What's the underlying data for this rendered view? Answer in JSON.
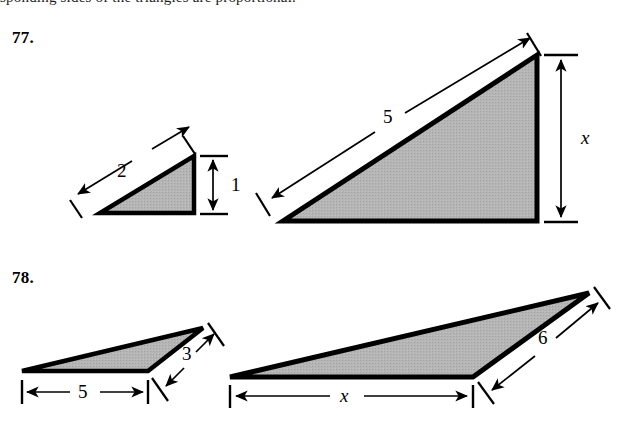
{
  "page": {
    "top_cut_text": "sponding sides of the triangles are proportional.",
    "background": "#ffffff",
    "ink_color": "#000000",
    "fill_color": "#b3b3b3"
  },
  "problems": [
    {
      "number": "77.",
      "figures": [
        {
          "name": "small-right-triangle",
          "labels": [
            {
              "text": "2",
              "role": "hypotenuse-length",
              "italic": false
            },
            {
              "text": "1",
              "role": "vertical-leg-length",
              "italic": false
            }
          ]
        },
        {
          "name": "large-right-triangle",
          "labels": [
            {
              "text": "5",
              "role": "hypotenuse-length",
              "italic": false
            },
            {
              "text": "x",
              "role": "vertical-leg-unknown",
              "italic": true
            }
          ]
        }
      ]
    },
    {
      "number": "78.",
      "figures": [
        {
          "name": "small-oblique-triangle",
          "labels": [
            {
              "text": "5",
              "role": "base-length",
              "italic": false
            },
            {
              "text": "3",
              "role": "right-side-length",
              "italic": false
            }
          ]
        },
        {
          "name": "large-oblique-triangle",
          "labels": [
            {
              "text": "x",
              "role": "base-unknown",
              "italic": true
            },
            {
              "text": "6",
              "role": "right-side-length",
              "italic": false
            }
          ]
        }
      ]
    }
  ],
  "labels": {
    "p77_small_hyp": "2",
    "p77_small_vert": "1",
    "p77_large_hyp": "5",
    "p77_large_vert": "x",
    "p78_small_base": "5",
    "p78_small_side": "3",
    "p78_large_base": "x",
    "p78_large_side": "6"
  }
}
